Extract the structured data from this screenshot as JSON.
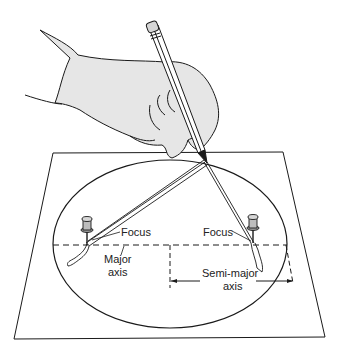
{
  "figure": {
    "labels": {
      "focus_left": "Focus",
      "focus_right": "Focus",
      "major_axis_line1": "Major",
      "major_axis_line2": "axis",
      "semi_major_line1": "Semi-major",
      "semi_major_line2": "axis"
    },
    "colors": {
      "line": "#1a1a1a",
      "hand_fill": "#e6e6e6",
      "paper": "#ffffff",
      "pin_fill": "#9a9a9a"
    }
  }
}
